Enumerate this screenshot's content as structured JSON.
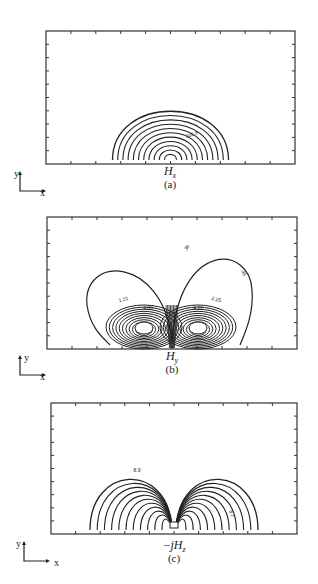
{
  "figure": {
    "panels": [
      {
        "id": "a",
        "field_symbol": "H",
        "field_subscript": "x",
        "field_prefix": "",
        "caption": "(a)",
        "contour_label": "305.9",
        "frame": {
          "x": 46,
          "y": 31,
          "w": 249,
          "h": 133
        },
        "contour_type": "single-lobe",
        "contour_count": 11
      },
      {
        "id": "b",
        "field_symbol": "H",
        "field_subscript": "y",
        "field_prefix": "",
        "caption": "(b)",
        "contour_labels": [
          ".36",
          ".36",
          "1.21",
          "2.25",
          "4.80",
          "4.21"
        ],
        "frame": {
          "x": 47,
          "y": 217,
          "w": 250,
          "h": 132
        },
        "contour_type": "double-lobe-with-cores",
        "contour_count": 12
      },
      {
        "id": "c",
        "field_symbol": "H",
        "field_subscript": "z",
        "field_prefix": "−j",
        "caption": "(c)",
        "contour_labels": [
          "8.9",
          "8.7"
        ],
        "frame": {
          "x": 51,
          "y": 403,
          "w": 246,
          "h": 131
        },
        "contour_type": "double-lobe",
        "contour_count": 11
      }
    ],
    "axis_indicator": {
      "y_label": "y",
      "x_label": "x"
    },
    "frame_ticks": {
      "top": 9,
      "bottom": 9,
      "left": 9,
      "right": 9
    }
  }
}
